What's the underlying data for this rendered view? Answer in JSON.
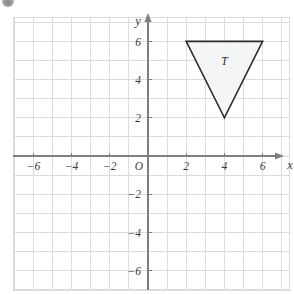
{
  "figure": {
    "kind": "coordinate-plane",
    "background_color": "#ffffff",
    "grid_color": "#d8dce3",
    "axis_color": "#7d7d82",
    "label_color": "#3b3b3f"
  },
  "axes": {
    "x_axis_label": "x",
    "y_axis_label": "y",
    "origin_label": "O",
    "x_ticks": [
      {
        "value": -6,
        "label": "−6"
      },
      {
        "value": -4,
        "label": "−4"
      },
      {
        "value": -2,
        "label": "−2"
      },
      {
        "value": 2,
        "label": "2"
      },
      {
        "value": 4,
        "label": "4"
      },
      {
        "value": 6,
        "label": "6"
      }
    ],
    "y_ticks": [
      {
        "value": 6,
        "label": "6"
      },
      {
        "value": 4,
        "label": "4"
      },
      {
        "value": 2,
        "label": "2"
      },
      {
        "value": -2,
        "label": "−2"
      },
      {
        "value": -4,
        "label": "−4"
      },
      {
        "value": -6,
        "label": "−6"
      }
    ]
  },
  "chart_data": {
    "type": "scatter",
    "title": "",
    "xlabel": "x",
    "ylabel": "y",
    "xlim": [
      -7,
      7
    ],
    "ylim": [
      -7,
      7
    ],
    "grid": true,
    "grid_step": 1,
    "legend": "none",
    "shapes": [
      {
        "name": "T",
        "label": "T",
        "type": "triangle",
        "vertices": [
          {
            "x": 2,
            "y": 6
          },
          {
            "x": 6,
            "y": 6
          },
          {
            "x": 4,
            "y": 2
          }
        ],
        "label_position": {
          "x": 4,
          "y": 5
        },
        "fill": "#f4f5f7",
        "stroke": "#2b2b2e",
        "stroke_width": 1.6
      }
    ]
  }
}
